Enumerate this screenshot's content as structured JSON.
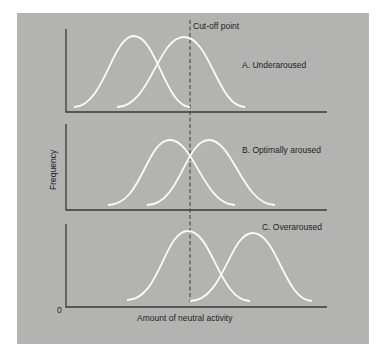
{
  "figure": {
    "background": "#b3b3b1",
    "curve_color": "#fafafa",
    "axis_color": "#3a3a3a",
    "cutoff_label": "Cut-off point",
    "y_axis_label": "Frequency",
    "x_axis_label": "Amount of neutral activity",
    "origin_label": "0",
    "panels": [
      {
        "id": "A",
        "label": "A. Underaroused",
        "curves": [
          {
            "start": 74,
            "peak": 134,
            "end": 190
          },
          {
            "start": 117,
            "peak": 184,
            "end": 245
          }
        ]
      },
      {
        "id": "B",
        "label": "B. Optimally aroused",
        "curves": [
          {
            "start": 108,
            "peak": 170,
            "end": 235
          },
          {
            "start": 147,
            "peak": 209,
            "end": 275
          }
        ]
      },
      {
        "id": "C",
        "label": "C. Overaroused",
        "curves": [
          {
            "start": 127,
            "peak": 188,
            "end": 250
          },
          {
            "start": 190,
            "peak": 253,
            "end": 312
          }
        ]
      }
    ]
  }
}
